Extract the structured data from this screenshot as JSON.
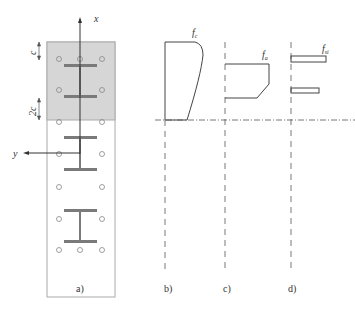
{
  "panels": {
    "a": {
      "caption": "a)",
      "axis_x_label": "x",
      "axis_y_label": "y",
      "dim1_label": "c",
      "dim2_label": "2c"
    },
    "b": {
      "caption": "b)",
      "stress_label": "f",
      "stress_sub": "c"
    },
    "c": {
      "caption": "c)",
      "stress_label": "f",
      "stress_sub": "a"
    },
    "d": {
      "caption": "d)",
      "stress_label": "f",
      "stress_sub": "si"
    }
  },
  "colors": {
    "shaded_region": "#d6d6d6",
    "section_outline": "#999999",
    "steel_profile": "#7a7a7a",
    "line": "#444444"
  }
}
